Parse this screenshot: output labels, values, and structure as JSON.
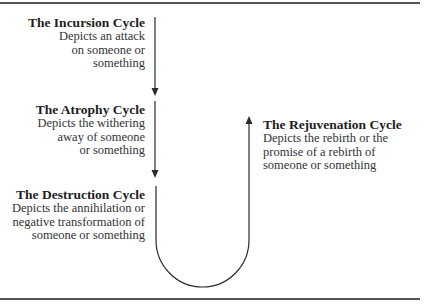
{
  "diagram": {
    "cycles": [
      {
        "id": "incursion",
        "title": "The Incursion Cycle",
        "description_lines": [
          "Depicts an attack",
          "on someone or",
          "something"
        ]
      },
      {
        "id": "atrophy",
        "title": "The Atrophy Cycle",
        "description_lines": [
          "Depicts the withering",
          "away of someone",
          "or something"
        ]
      },
      {
        "id": "destruction",
        "title": "The Destruction Cycle",
        "description_lines": [
          "Depicts the annihilation or",
          "negative transformation of",
          "someone or something"
        ]
      },
      {
        "id": "rejuvenation",
        "title": "The Rejuvenation Cycle",
        "description_lines": [
          "Depicts the rebirth or the",
          "promise of a rebirth of",
          "someone or something"
        ]
      }
    ],
    "flow": [
      "incursion",
      "atrophy",
      "destruction",
      "rejuvenation"
    ],
    "colors": {
      "line": "#2a2a2a",
      "rule": "#555555",
      "text": "#2a2a2a"
    }
  }
}
